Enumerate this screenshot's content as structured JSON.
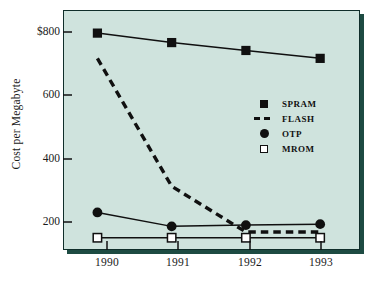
{
  "chart_data": {
    "type": "line",
    "title": "",
    "xlabel": "",
    "ylabel": "Cost per Megabyte",
    "categories": [
      "1990",
      "1991",
      "1992",
      "1993"
    ],
    "x": [
      1990,
      1991,
      1992,
      1993
    ],
    "xlim": [
      1989.55,
      1993.55
    ],
    "ylim": [
      110,
      870
    ],
    "grid": false,
    "legend_position": "inside-right",
    "y_ticks": [
      200,
      400,
      600,
      800
    ],
    "y_tick_labels": [
      "200",
      "400",
      "600",
      "$800"
    ],
    "x_ticks": [
      1990,
      1991,
      1992,
      1993
    ],
    "x_tick_labels": [
      "1990",
      "1991",
      "1992",
      "1993"
    ],
    "series": [
      {
        "name": "SPRAM",
        "marker": "filled-square",
        "line": "solid",
        "values": [
          800,
          770,
          745,
          720
        ]
      },
      {
        "name": "FLASH",
        "marker": "none",
        "line": "dashed",
        "values": [
          720,
          315,
          170,
          170
        ]
      },
      {
        "name": "OTP",
        "marker": "filled-circle",
        "line": "solid",
        "values": [
          232,
          188,
          192,
          195
        ]
      },
      {
        "name": "MROM",
        "marker": "open-square",
        "line": "solid",
        "values": [
          152,
          152,
          152,
          152
        ]
      }
    ]
  },
  "colors": {
    "panel_background": "#cfe3dd",
    "panel_border": "#102e2a",
    "panel_shadow": "#1d4b42",
    "ink": "#101010",
    "page_background": "#ffffff"
  },
  "legend": {
    "items": [
      {
        "label": "SPRAM",
        "key": "filled-square-key"
      },
      {
        "label": "FLASH",
        "key": "dashed-line-key"
      },
      {
        "label": "OTP",
        "key": "filled-circle-key"
      },
      {
        "label": "MROM",
        "key": "open-square-key"
      }
    ]
  }
}
